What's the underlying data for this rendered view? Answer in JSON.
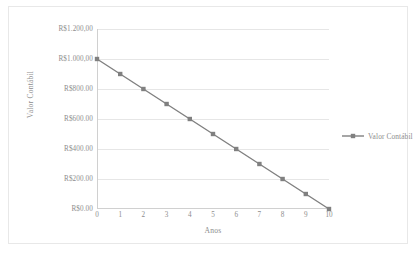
{
  "chart_data": {
    "type": "line",
    "title": "",
    "xlabel": "Anos",
    "ylabel": "Valor Contábil",
    "x": [
      0,
      1,
      2,
      3,
      4,
      5,
      6,
      7,
      8,
      9,
      10
    ],
    "xtick_labels": [
      "0",
      "1",
      "2",
      "3",
      "4",
      "5",
      "6",
      "7",
      "8",
      "9",
      "10"
    ],
    "xlim": [
      0,
      10
    ],
    "ylim": [
      0,
      1200
    ],
    "ytick_values": [
      0,
      200,
      400,
      600,
      800,
      1000,
      1200
    ],
    "ytick_labels": [
      "R$0.00",
      "R$200.00",
      "R$400.00",
      "R$600.00",
      "R$800.00",
      "R$1.000,00",
      "R$1.200,00"
    ],
    "grid": true,
    "grid_axis": "y",
    "legend_position": "right",
    "series": [
      {
        "name": "Valor Contábil",
        "color": "#808080",
        "marker": "square",
        "values": [
          1000,
          900,
          800,
          700,
          600,
          500,
          400,
          300,
          200,
          100,
          0
        ]
      }
    ]
  },
  "legend": {
    "entries": [
      {
        "label": "Valor Contábil",
        "color": "#808080"
      }
    ]
  },
  "colors": {
    "series": "#808080",
    "gridline": "#e6e6e6",
    "axis": "#d0d0d0",
    "text": "#8d8d8d",
    "frame": "#e8e8e8",
    "background": "#ffffff"
  }
}
